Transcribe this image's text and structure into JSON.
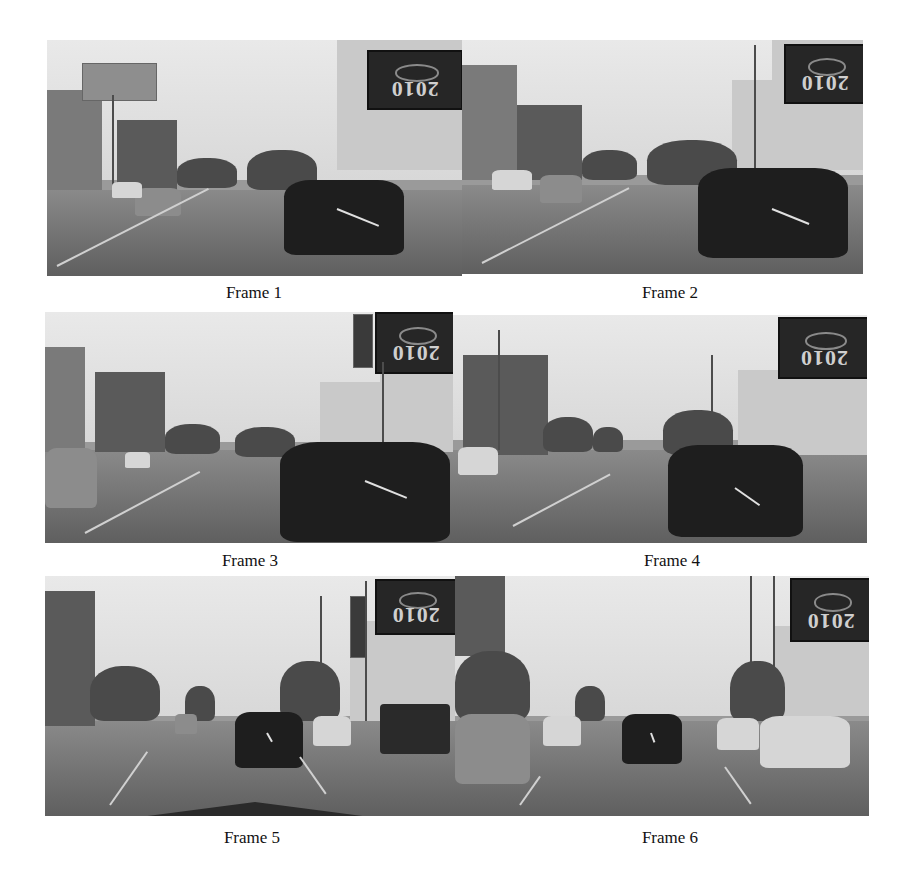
{
  "figure": {
    "frames": [
      {
        "id": 1,
        "caption": "Frame 1",
        "billboard_text": "2010"
      },
      {
        "id": 2,
        "caption": "Frame 2",
        "billboard_text": "2010"
      },
      {
        "id": 3,
        "caption": "Frame 3",
        "billboard_text": "2010"
      },
      {
        "id": 4,
        "caption": "Frame 4",
        "billboard_text": "2010"
      },
      {
        "id": 5,
        "caption": "Frame 5",
        "billboard_text": "2010"
      },
      {
        "id": 6,
        "caption": "Frame 6",
        "billboard_text": "2010"
      }
    ]
  },
  "colors": {
    "background": "#ffffff",
    "caption_text": "#111111",
    "sky": "#e0e0e0",
    "road": "#6f6f6f",
    "car_dark": "#1e1e1e"
  }
}
